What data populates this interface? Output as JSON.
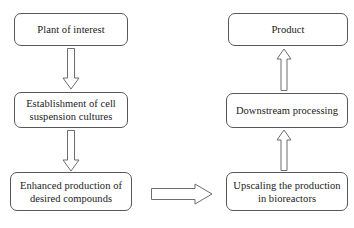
{
  "diagram": {
    "background_color": "#ffffff",
    "line_color": "#58585a",
    "text_color": "#1a1a1a",
    "nodes": [
      {
        "id": "plant-of-interest",
        "label": "Plant of interest",
        "column": "left",
        "order": 1
      },
      {
        "id": "establishment-of-cell-suspension-cultures",
        "label": "Establishment of cell\nsuspension cultures",
        "column": "left",
        "order": 2
      },
      {
        "id": "enhanced-production-of-desired-compounds",
        "label": "Enhanced production of\ndesired compounds",
        "column": "left",
        "order": 3
      },
      {
        "id": "upscaling-the-production-in-bioreactors",
        "label": "Upscaling the production\nin bioreactors",
        "column": "right",
        "order": 4
      },
      {
        "id": "downstream-processing",
        "label": "Downstream processing",
        "column": "right",
        "order": 5
      },
      {
        "id": "product",
        "label": "Product",
        "column": "right",
        "order": 6
      }
    ],
    "arrows": [
      {
        "id": "arrow-plant-to-establishment",
        "direction": "down",
        "from": "plant-of-interest",
        "to": "establishment-of-cell-suspension-cultures"
      },
      {
        "id": "arrow-establishment-to-enhanced",
        "direction": "down",
        "from": "establishment-of-cell-suspension-cultures",
        "to": "enhanced-production-of-desired-compounds"
      },
      {
        "id": "arrow-enhanced-to-upscaling",
        "direction": "right",
        "from": "enhanced-production-of-desired-compounds",
        "to": "upscaling-the-production-in-bioreactors"
      },
      {
        "id": "arrow-upscaling-to-downstream",
        "direction": "up",
        "from": "upscaling-the-production-in-bioreactors",
        "to": "downstream-processing"
      },
      {
        "id": "arrow-downstream-to-product",
        "direction": "up",
        "from": "downstream-processing",
        "to": "product"
      }
    ]
  }
}
